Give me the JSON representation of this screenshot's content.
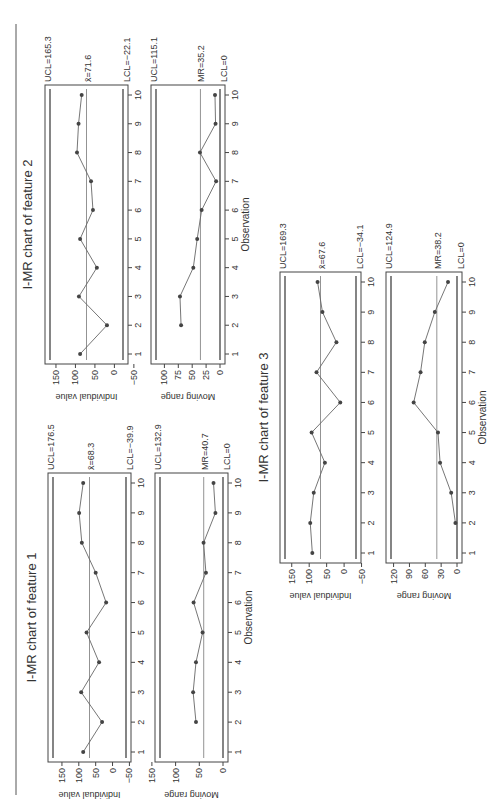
{
  "page": {
    "orientation": "rotated-90-ccw",
    "figures": [
      "feature1",
      "feature2",
      "feature3"
    ]
  },
  "chart_data": [
    {
      "type": "line",
      "title": "I-MR chart of feature 1",
      "panels": [
        {
          "name": "individual",
          "ylabel": "Individual value",
          "xlabel": "",
          "x": [
            1,
            2,
            3,
            4,
            5,
            6,
            7,
            8,
            9,
            10
          ],
          "values": [
            87,
            31,
            93,
            40,
            77,
            19,
            50,
            91,
            99,
            87
          ],
          "ylim": [
            -50,
            180
          ],
          "yticks": [
            150,
            100,
            50,
            0,
            -50
          ],
          "ucl": 176.5,
          "center": 68.3,
          "lcl": -39.9,
          "ucl_label": "UCL=176.5",
          "center_label": "x̄=68.3",
          "lcl_label": "LCL=−39.9"
        },
        {
          "name": "moving-range",
          "ylabel": "Moving range",
          "xlabel": "Observation",
          "x": [
            2,
            3,
            4,
            5,
            6,
            7,
            8,
            9,
            10
          ],
          "values": [
            57,
            63,
            57,
            43,
            62,
            36,
            41,
            16,
            20
          ],
          "ylim": [
            0,
            150
          ],
          "yticks": [
            150,
            100,
            50,
            0
          ],
          "ucl": 132.9,
          "center": 40.7,
          "lcl": 0,
          "ucl_label": "UCL=132.9",
          "center_label": "MR=40.7",
          "lcl_label": "LCL=0"
        }
      ],
      "xticks": [
        1,
        2,
        3,
        4,
        5,
        6,
        7,
        8,
        9,
        10
      ],
      "grid": false
    },
    {
      "type": "line",
      "title": "I-MR chart of feature 2",
      "panels": [
        {
          "name": "individual",
          "ylabel": "Individual value",
          "xlabel": "",
          "x": [
            1,
            2,
            3,
            4,
            5,
            6,
            7,
            8,
            9,
            10
          ],
          "values": [
            88,
            19,
            91,
            45,
            88,
            55,
            60,
            96,
            92,
            84
          ],
          "ylim": [
            -50,
            170
          ],
          "yticks": [
            150,
            100,
            50,
            0,
            -50
          ],
          "ucl": 165.3,
          "center": 71.6,
          "lcl": -22.1,
          "ucl_label": "UCL=165.3",
          "center_label": "x̄=71.6",
          "lcl_label": "LCL=−22.1"
        },
        {
          "name": "moving-range",
          "ylabel": "Moving range",
          "xlabel": "Observation",
          "x": [
            2,
            3,
            4,
            5,
            6,
            7,
            8,
            9,
            10
          ],
          "values": [
            70,
            72,
            48,
            41,
            33,
            7,
            36,
            8,
            9
          ],
          "ylim": [
            0,
            120
          ],
          "yticks": [
            100,
            75,
            50,
            25,
            0
          ],
          "ucl": 115.1,
          "center": 35.2,
          "lcl": 0,
          "ucl_label": "UCL=115.1",
          "center_label": "MR=35.2",
          "lcl_label": "LCL=0"
        }
      ],
      "xticks": [
        1,
        2,
        3,
        4,
        5,
        6,
        7,
        8,
        9,
        10
      ],
      "grid": false
    },
    {
      "type": "line",
      "title": "I-MR chart of feature 3",
      "panels": [
        {
          "name": "individual",
          "ylabel": "Individual value",
          "xlabel": "",
          "x": [
            1,
            2,
            3,
            4,
            5,
            6,
            7,
            8,
            9,
            10
          ],
          "values": [
            91,
            97,
            87,
            55,
            93,
            11,
            79,
            22,
            62,
            76
          ],
          "ylim": [
            -50,
            175
          ],
          "yticks": [
            150,
            100,
            50,
            0,
            -50
          ],
          "ucl": 169.3,
          "center": 67.6,
          "lcl": -34.1,
          "ucl_label": "UCL=169.3",
          "center_label": "x̄=67.6",
          "lcl_label": "LCL=−34.1"
        },
        {
          "name": "moving-range",
          "ylabel": "Moving range",
          "xlabel": "Observation",
          "x": [
            2,
            3,
            4,
            5,
            6,
            7,
            8,
            9,
            10
          ],
          "values": [
            3,
            11,
            32,
            36,
            82,
            69,
            61,
            42,
            17
          ],
          "ylim": [
            0,
            130
          ],
          "yticks": [
            120,
            90,
            60,
            30,
            0
          ],
          "ucl": 124.9,
          "center": 38.2,
          "lcl": 0,
          "ucl_label": "UCL=124.9",
          "center_label": "MR=38.2",
          "lcl_label": "LCL=0"
        }
      ],
      "xticks": [
        1,
        2,
        3,
        4,
        5,
        6,
        7,
        8,
        9,
        10
      ],
      "grid": false
    }
  ],
  "layout": {
    "feature2": {
      "box_x": 438,
      "box_w": 279,
      "ind_y": [
        45,
        128
      ],
      "mr_y": [
        151,
        225
      ],
      "title_y": 26
    },
    "feature1": {
      "box_x": 40,
      "box_w": 289,
      "ind_y": [
        48,
        131
      ],
      "mr_y": [
        155,
        228
      ],
      "title_y": 30
    },
    "feature3": {
      "box_x": 239,
      "box_w": 291,
      "ind_y": [
        280,
        361
      ],
      "mr_y": [
        386,
        462
      ],
      "title_y": 262
    }
  }
}
